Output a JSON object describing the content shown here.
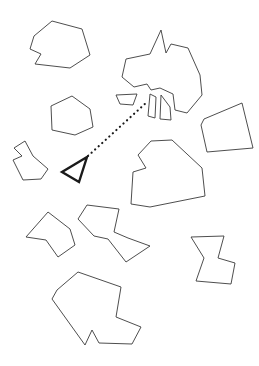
{
  "canvas": {
    "width": 259,
    "height": 366,
    "background_color": "#ffffff",
    "outline_color": "#3a3a3a",
    "highlight_color": "#1a1a1a",
    "stroke_width": 0.9,
    "highlight_stroke_width": 2.4
  },
  "shapes": [
    {
      "id": "shape-top-left-hexagon",
      "name": "top-left-hexagon",
      "role": "scattered-piece",
      "points": "52,21 82,29 90,55 70,68 35,64 41,54 30,49 34,36",
      "stroke": "#3a3a3a",
      "stroke_width": 0.9
    },
    {
      "id": "shape-top-right-arrow-cluster",
      "name": "top-right-large-arrow",
      "role": "scattered-piece",
      "points": "161,30 150,54 126,59 122,77 134,87 147,84 151,90 160,88 173,94 175,110 187,113 202,95 200,75 188,48 171,44 166,53"
    },
    {
      "id": "shape-fragment-trapezoid",
      "name": "fragment-trapezoid",
      "role": "fragment-piece",
      "points": "116,95 137,94 133,105 120,104"
    },
    {
      "id": "shape-fragment-sliver-left",
      "name": "fragment-sliver-left",
      "role": "fragment-piece",
      "points": "150,94 156,97 155,118 148,116"
    },
    {
      "id": "shape-fragment-sliver-right",
      "name": "fragment-sliver-right",
      "role": "fragment-piece",
      "points": "161,95 170,107 171,120 160,119"
    },
    {
      "id": "shape-left-pentagon",
      "name": "left-pentagon",
      "role": "scattered-piece",
      "points": "72,96 90,109 93,127 75,135 52,130 51,106"
    },
    {
      "id": "shape-left-arrow-notched",
      "name": "left-notched-arrow",
      "role": "scattered-piece",
      "points": "25,141 33,156 48,169 41,179 23,180 13,160 22,156 14,148"
    },
    {
      "id": "shape-right-wedge",
      "name": "right-wedge-quad",
      "role": "scattered-piece",
      "points": "242,103 253,148 207,152 201,125 204,119"
    },
    {
      "id": "shape-center-house",
      "name": "center-house-polygon",
      "role": "scattered-piece",
      "points": "151,141 172,140 202,168 205,196 150,207 131,204 133,172 146,168 138,155"
    },
    {
      "id": "shape-mid-left-quad",
      "name": "mid-left-quad",
      "role": "scattered-piece",
      "points": "48,212 70,229 75,245 58,257 46,240 26,237"
    },
    {
      "id": "shape-zigzag",
      "name": "zigzag-polygon",
      "role": "scattered-piece",
      "points": "87,205 119,209 114,232 128,238 150,246 126,262 108,239 94,236 78,219"
    },
    {
      "id": "shape-bottom-right-notched",
      "name": "bottom-right-notched-block",
      "role": "scattered-piece",
      "points": "191,237 224,236 218,258 235,263 231,284 196,281 204,258"
    },
    {
      "id": "shape-bottom-large",
      "name": "bottom-large-polygon",
      "role": "scattered-piece",
      "points": "78,272 121,287 116,317 141,327 132,344 99,343 92,330 85,345 52,299 57,290"
    }
  ],
  "cursor": {
    "name": "selected-triangle-cursor",
    "points": "87,157 62,172 79,182",
    "stroke": "#1a1a1a",
    "stroke_width": 2.4
  },
  "leader": {
    "name": "dotted-leader-line",
    "from_x": 88,
    "from_y": 156,
    "to_x": 147,
    "to_y": 102,
    "stroke": "#1a1a1a",
    "stroke_width": 2.1,
    "dash_pattern": "0.2 4.6"
  }
}
